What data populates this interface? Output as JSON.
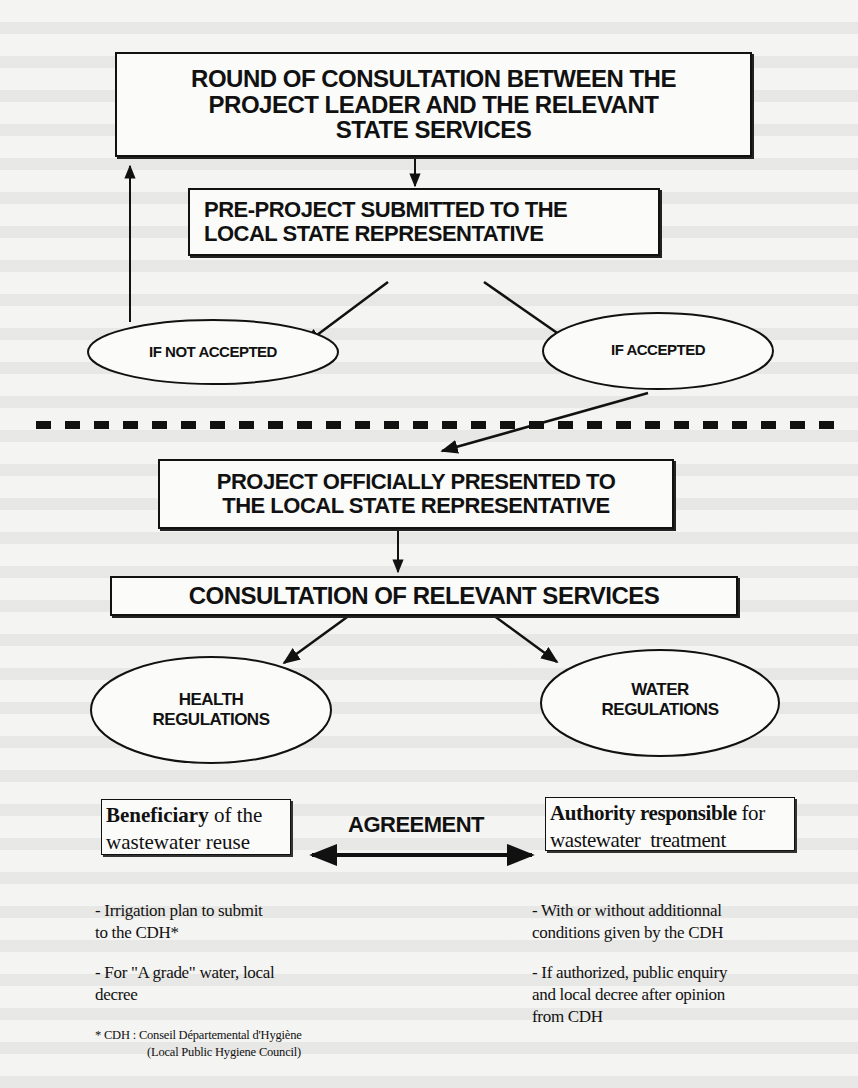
{
  "diagram": {
    "top_phase": {
      "consultation_box": {
        "line1": "ROUND OF CONSULTATION BETWEEN THE",
        "line2": "PROJECT LEADER AND THE RELEVANT",
        "line3": "STATE SERVICES"
      },
      "preproject_box": {
        "line1": "PRE-PROJECT SUBMITTED TO THE",
        "line2": "LOCAL STATE REPRESENTATIVE"
      },
      "outcomes": [
        {
          "label": "IF NOT ACCEPTED"
        },
        {
          "label": "IF ACCEPTED"
        }
      ]
    },
    "bottom_phase": {
      "official_box": {
        "line1": "PROJECT OFFICIALLY PRESENTED TO",
        "line2": "THE LOCAL STATE REPRESENTATIVE"
      },
      "services_box": {
        "label": "CONSULTATION OF RELEVANT SERVICES"
      },
      "regulations": [
        {
          "line1": "HEALTH",
          "line2": "REGULATIONS"
        },
        {
          "line1": "WATER",
          "line2": "REGULATIONS"
        }
      ]
    },
    "agreement": {
      "label": "AGREEMENT",
      "beneficiary": {
        "bold": "Beneficiary",
        "rest1": " of the",
        "line2": "wastewater reuse",
        "notes": [
          {
            "line1": "- Irrigation plan to submit",
            "line2": "to the CDH*"
          },
          {
            "line1": "- For \"A grade\" water, local",
            "line2": "decree"
          }
        ]
      },
      "authority": {
        "bold": "Authority responsible",
        "rest1": " for",
        "line2": "wastewater  treatment",
        "notes": [
          {
            "line1": "- With or without additionnal",
            "line2": "conditions given by the CDH"
          },
          {
            "line1": "- If authorized, public enquiry",
            "line2": "and local decree after opinion",
            "line3": "from CDH"
          }
        ]
      }
    },
    "footnote": {
      "line1": "* CDH : Conseil Départemental d'Hygiène",
      "line2": "(Local Public Hygiene Council)"
    },
    "colors": {
      "ink": "#111111",
      "paper": "#f4f4f2"
    }
  }
}
